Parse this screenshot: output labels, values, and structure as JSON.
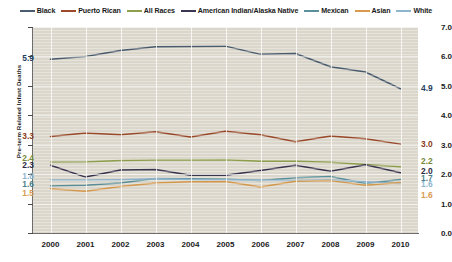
{
  "chart_data": {
    "type": "line",
    "title": "",
    "xlabel": "",
    "ylabel": "Pre-term Related Infant Deaths",
    "categories": [
      "2000",
      "2001",
      "2002",
      "2003",
      "2004",
      "2005",
      "2006",
      "2007",
      "2008",
      "2009",
      "2010"
    ],
    "x": [
      2000,
      2001,
      2002,
      2003,
      2004,
      2005,
      2006,
      2007,
      2008,
      2009,
      2010
    ],
    "ylim": [
      0.0,
      7.0
    ],
    "ytick_labels": [
      "0.0",
      "1.0",
      "2.0",
      "3.0",
      "4.0",
      "5.0",
      "6.0",
      "7.0"
    ],
    "ytick_values": [
      0.0,
      1.0,
      2.0,
      3.0,
      4.0,
      5.0,
      6.0,
      7.0
    ],
    "grid": true,
    "legend_position": "top",
    "series": [
      {
        "name": "Black",
        "color": "#4a5c6e",
        "values": [
          5.9,
          6.0,
          6.2,
          6.33,
          6.34,
          6.35,
          6.07,
          6.1,
          5.65,
          5.47,
          4.9
        ],
        "start_label": "5.9",
        "end_label": "4.9",
        "start_label_color": "#24405e",
        "end_label_color": "#24405e"
      },
      {
        "name": "Puerto Rican",
        "color": "#9c4a2a",
        "values": [
          3.28,
          3.4,
          3.34,
          3.44,
          3.26,
          3.46,
          3.34,
          3.1,
          3.3,
          3.2,
          3.02
        ],
        "start_label": "3.3",
        "end_label": "3.0",
        "start_label_color": "#8a3b21",
        "end_label_color": "#8a3b21"
      },
      {
        "name": "All Races",
        "color": "#8fa04c",
        "values": [
          2.4,
          2.41,
          2.46,
          2.48,
          2.48,
          2.49,
          2.44,
          2.44,
          2.4,
          2.33,
          2.25
        ],
        "start_label": "2.4",
        "end_label": "2.2",
        "start_label_color": "#76883a",
        "end_label_color": "#76883a"
      },
      {
        "name": "American Indian/Alaska Native",
        "color": "#3a3550",
        "values": [
          2.3,
          1.9,
          2.14,
          2.16,
          1.96,
          1.96,
          2.12,
          2.3,
          2.1,
          2.32,
          2.05
        ],
        "start_label": "2.3",
        "end_label": "2.0",
        "start_label_color": "#2b2740",
        "end_label_color": "#2b2740"
      },
      {
        "name": "Mexican",
        "color": "#5a9099",
        "values": [
          1.6,
          1.62,
          1.7,
          1.85,
          1.84,
          1.83,
          1.78,
          1.88,
          1.92,
          1.68,
          1.82
        ],
        "start_label": "1.6",
        "end_label": "1.7",
        "start_label_color": "#4d8189",
        "end_label_color": "#4d8189"
      },
      {
        "name": "White",
        "color": "#8fb6cf",
        "values": [
          1.8,
          1.8,
          1.81,
          1.84,
          1.82,
          1.81,
          1.8,
          1.78,
          1.8,
          1.74,
          1.68
        ],
        "start_label": "1.8",
        "end_label": "1.6",
        "start_label_color": "#8fb6cf",
        "end_label_color": "#8fb6cf"
      },
      {
        "name": "Asian",
        "color": "#d79a4e",
        "values": [
          1.5,
          1.42,
          1.58,
          1.7,
          1.74,
          1.75,
          1.56,
          1.76,
          1.78,
          1.62,
          1.72
        ],
        "start_label": "1.5",
        "end_label": "1.6",
        "start_label_color": "#d79a4e",
        "end_label_color": "#d79a4e"
      }
    ]
  },
  "legend": {
    "items": [
      {
        "label": "Black",
        "color": "#4a5c6e"
      },
      {
        "label": "Puerto Rican",
        "color": "#9c4a2a"
      },
      {
        "label": "All Races",
        "color": "#8fa04c"
      },
      {
        "label": "American Indian/Alaska Native",
        "color": "#3a3550"
      },
      {
        "label": "Mexican",
        "color": "#5a9099"
      },
      {
        "label": "Asian",
        "color": "#d79a4e"
      },
      {
        "label": "White",
        "color": "#8fb6cf"
      }
    ]
  }
}
